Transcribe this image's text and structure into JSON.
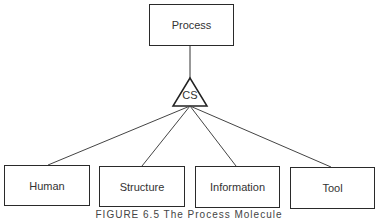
{
  "diagram": {
    "root": {
      "label": "Process"
    },
    "connector": {
      "label": "CS",
      "shape": "triangle"
    },
    "children": [
      {
        "label": "Human"
      },
      {
        "label": "Structure"
      },
      {
        "label": "Information"
      },
      {
        "label": "Tool"
      }
    ],
    "caption": "FIGURE 6.5   The Process Molecule",
    "colors": {
      "line": "#2a2a2a",
      "text": "#333333",
      "background": "#ffffff"
    }
  }
}
